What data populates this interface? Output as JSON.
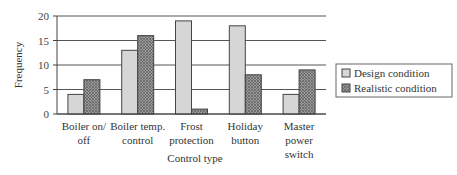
{
  "chart_data": {
    "type": "bar",
    "title": "",
    "xlabel": "Control type",
    "ylabel": "Frequency",
    "ylim": [
      0,
      20
    ],
    "yticks": [
      0,
      5,
      10,
      15,
      20
    ],
    "grid": true,
    "legend_position": "right",
    "categories": [
      [
        "Boiler on/",
        "off"
      ],
      [
        "Boiler temp.",
        "control"
      ],
      [
        "Frost",
        "protection"
      ],
      [
        "Holiday",
        "button"
      ],
      [
        "Master",
        "power",
        "switch"
      ]
    ],
    "series": [
      {
        "name": "Design condition",
        "values": [
          4,
          13,
          19,
          18,
          4
        ],
        "color": "#d6d6d6",
        "pattern": "solid"
      },
      {
        "name": "Realistic condition",
        "values": [
          7,
          16,
          1,
          8,
          9
        ],
        "color": "#8a8a8a",
        "pattern": "crosshatch"
      }
    ]
  },
  "colors": {
    "axis": "#444444",
    "grid": "#555555",
    "bar_border": "#444444"
  }
}
